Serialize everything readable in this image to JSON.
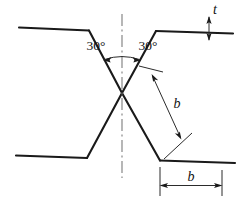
{
  "drawing": {
    "title": "Double-V (X) groove weld preparation",
    "background_color": "#ffffff",
    "line_color": "#1a1a1a",
    "centerline_color": "#7c7c7c",
    "dimension_color": "#2b2b2b",
    "angles": {
      "left_label": "30°",
      "right_label": "30°",
      "value_degrees": 30,
      "arc_type": "angular-dimension-arc"
    },
    "dimensions": [
      {
        "id": "thickness",
        "label": "t",
        "orientation": "vertical",
        "location": "top-right",
        "description": "plate thickness callout with vertical dimension line"
      },
      {
        "id": "bevel-face-diagonal",
        "label": "b",
        "orientation": "diagonal",
        "location": "right-center",
        "description": "bevel face length along the inclined groove face"
      },
      {
        "id": "bevel-width-horizontal",
        "label": "b",
        "orientation": "horizontal",
        "location": "bottom-right",
        "description": "horizontal projection of bevel width"
      }
    ],
    "centerline": {
      "style": "dash-dot",
      "orientation": "vertical",
      "label": "axis-of-symmetry"
    }
  }
}
